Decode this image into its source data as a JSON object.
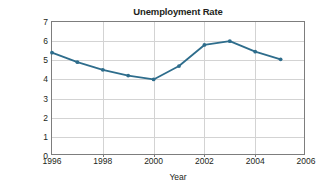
{
  "chart_data": {
    "type": "line",
    "title": "Unemployment Rate",
    "xlabel": "Year",
    "ylabel": "Percentage of population unemployed",
    "ylabel_line1": "Percentage of population",
    "ylabel_line2": "unemployed",
    "x": [
      1996,
      1997,
      1998,
      1999,
      2000,
      2001,
      2002,
      2003,
      2004,
      2005
    ],
    "values": [
      5.4,
      4.9,
      4.5,
      4.2,
      4.0,
      4.7,
      5.8,
      6.0,
      5.45,
      5.05
    ],
    "series": [
      {
        "name": "Unemployment Rate",
        "values": [
          5.4,
          4.9,
          4.5,
          4.2,
          4.0,
          4.7,
          5.8,
          6.0,
          5.45,
          5.05
        ]
      }
    ],
    "xlim": [
      1996,
      2006
    ],
    "ylim": [
      0,
      7
    ],
    "xticks": [
      1996,
      1998,
      2000,
      2002,
      2004,
      2006
    ],
    "xtick_labels": [
      "1996",
      "1998",
      "2000",
      "2002",
      "2004",
      "2006"
    ],
    "yticks": [
      0,
      1,
      2,
      3,
      4,
      5,
      6,
      7
    ],
    "ytick_labels": [
      "0",
      "1",
      "2",
      "3",
      "4",
      "5",
      "6",
      "7"
    ],
    "grid": "horizontal-and-vertical",
    "legend": "none",
    "line_color": "#2e6d8c",
    "marker": "circle",
    "marker_color": "#2e6d8c",
    "gridline_color": "#d3d3d3",
    "axis_color": "#7d7d7d",
    "text_color": "#231f20",
    "background_color": "#ffffff"
  }
}
